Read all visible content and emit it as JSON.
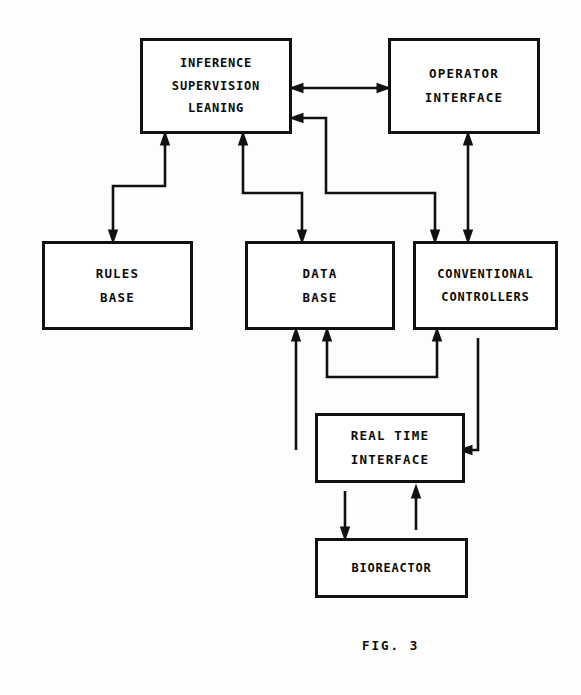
{
  "figure": {
    "label": "FIG. 3",
    "type": "block-diagram",
    "background_color": "#fdfdfc",
    "line_color": "#111111"
  },
  "nodes": [
    {
      "id": "inference",
      "lines": [
        "INFERENCE",
        "SUPERVISION",
        "LEANING"
      ],
      "x": 140,
      "y": 38,
      "w": 152,
      "h": 96
    },
    {
      "id": "operator_interface",
      "lines": [
        "OPERATOR",
        "INTERFACE"
      ],
      "x": 388,
      "y": 38,
      "w": 152,
      "h": 96
    },
    {
      "id": "rules_base",
      "lines": [
        "RULES",
        "BASE"
      ],
      "x": 42,
      "y": 241,
      "w": 151,
      "h": 89
    },
    {
      "id": "data_base",
      "lines": [
        "DATA",
        "BASE"
      ],
      "x": 245,
      "y": 241,
      "w": 150,
      "h": 89
    },
    {
      "id": "conventional_controllers",
      "lines": [
        "CONVENTIONAL",
        "CONTROLLERS"
      ],
      "x": 413,
      "y": 241,
      "w": 145,
      "h": 89
    },
    {
      "id": "real_time_interface",
      "lines": [
        "REAL TIME",
        "INTERFACE"
      ],
      "x": 315,
      "y": 413,
      "w": 150,
      "h": 70
    },
    {
      "id": "bioreactor",
      "lines": [
        "BIOREACTOR"
      ],
      "x": 315,
      "y": 538,
      "w": 153,
      "h": 60
    }
  ],
  "edges": [
    {
      "id": "inference-operator-bidirectional",
      "from": "inference",
      "to": "operator_interface",
      "direction": "both",
      "path": "M 300 88 L 380 88",
      "arrows": [
        {
          "x": 296,
          "y": 88,
          "dir": "left"
        },
        {
          "x": 384,
          "y": 88,
          "dir": "right"
        }
      ]
    },
    {
      "id": "controllers-to-inference",
      "from": "conventional_controllers",
      "to": "inference",
      "direction": "one",
      "path": "M 435 233 L 435 193 L 326 193 L 326 118 L 300 118",
      "arrows": [
        {
          "x": 296,
          "y": 118,
          "dir": "left"
        },
        {
          "x": 435,
          "y": 237,
          "dir": "down"
        }
      ]
    },
    {
      "id": "inference-to-rules-base",
      "from": "inference",
      "to": "rules_base",
      "direction": "one",
      "path": "M 165 142 L 165 186 L 113 186 L 113 233",
      "arrows": [
        {
          "x": 165,
          "y": 138,
          "dir": "up"
        },
        {
          "x": 113,
          "y": 237,
          "dir": "down"
        }
      ]
    },
    {
      "id": "inference-data-base",
      "from": "inference",
      "to": "data_base",
      "direction": "one",
      "path": "M 243 142 L 243 193 L 302 193 L 302 233",
      "arrows": [
        {
          "x": 243,
          "y": 138,
          "dir": "up"
        },
        {
          "x": 302,
          "y": 237,
          "dir": "down"
        }
      ]
    },
    {
      "id": "operator-controllers-bidirectional",
      "from": "operator_interface",
      "to": "conventional_controllers",
      "direction": "both",
      "path": "M 468 142 L 468 233",
      "arrows": [
        {
          "x": 468,
          "y": 138,
          "dir": "up"
        },
        {
          "x": 468,
          "y": 237,
          "dir": "down"
        }
      ]
    },
    {
      "id": "realtime-to-data-base-left",
      "from": "real_time_interface",
      "to": "data_base",
      "direction": "one",
      "path": "M 296 450 L 296 338",
      "arrows": [
        {
          "x": 296,
          "y": 334,
          "dir": "up"
        }
      ]
    },
    {
      "id": "controllers-to-data-base",
      "from": "conventional_controllers",
      "to": "data_base",
      "direction": "one",
      "path": "M 327 338 L 327 377 L 437 377 L 437 338",
      "arrows": [
        {
          "x": 327,
          "y": 334,
          "dir": "up"
        },
        {
          "x": 437,
          "y": 334,
          "dir": "up"
        }
      ]
    },
    {
      "id": "controllers-to-realtime",
      "from": "conventional_controllers",
      "to": "real_time_interface",
      "direction": "one",
      "path": "M 478 338 L 478 450 L 469 450",
      "arrows": [
        {
          "x": 465,
          "y": 450,
          "dir": "left"
        }
      ]
    },
    {
      "id": "realtime-to-bioreactor",
      "from": "real_time_interface",
      "to": "bioreactor",
      "direction": "one",
      "path": "M 345 491 L 345 530",
      "arrows": [
        {
          "x": 345,
          "y": 534,
          "dir": "down"
        }
      ]
    },
    {
      "id": "bioreactor-to-realtime",
      "from": "bioreactor",
      "to": "real_time_interface",
      "direction": "one",
      "path": "M 416 530 L 416 495",
      "arrows": [
        {
          "x": 416,
          "y": 491,
          "dir": "up"
        }
      ]
    }
  ]
}
